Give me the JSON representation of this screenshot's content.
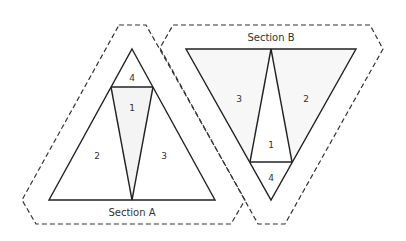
{
  "diagram": {
    "type": "paper-piecing pattern",
    "colors": {
      "line": "#222222",
      "dashed": "#333333",
      "fill": "#f7f7f7",
      "background": "#ffffff"
    },
    "sections": [
      {
        "id": "A",
        "label": "Section A",
        "orientation": "apex-up",
        "pieces": [
          {
            "number": "4",
            "position": "top tip"
          },
          {
            "number": "1",
            "position": "center"
          },
          {
            "number": "2",
            "position": "left"
          },
          {
            "number": "3",
            "position": "right"
          }
        ]
      },
      {
        "id": "B",
        "label": "Section B",
        "orientation": "apex-down",
        "pieces": [
          {
            "number": "3",
            "position": "left"
          },
          {
            "number": "2",
            "position": "right"
          },
          {
            "number": "1",
            "position": "center"
          },
          {
            "number": "4",
            "position": "bottom tip"
          }
        ]
      }
    ]
  }
}
